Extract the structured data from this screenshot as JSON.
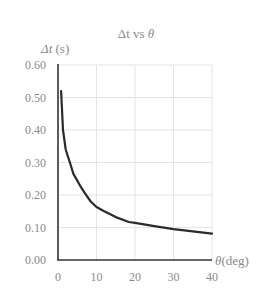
{
  "chart_data": {
    "type": "line",
    "title": "Δt vs θ",
    "xlabel": "θ (deg)",
    "ylabel": "Δt (s)",
    "xlim": [
      0,
      40
    ],
    "ylim": [
      0.0,
      0.6
    ],
    "grid": true,
    "legend": null,
    "x_ticks": [
      "0",
      "10",
      "20",
      "30",
      "40"
    ],
    "y_ticks": [
      "0.00",
      "0.10",
      "0.20",
      "0.30",
      "0.40",
      "0.50",
      "0.60"
    ],
    "series": [
      {
        "name": "Δt",
        "x": [
          0.8,
          1.3,
          2.0,
          3.1,
          4.0,
          5.7,
          7.0,
          8.5,
          10.0,
          12.0,
          15.0,
          18.4,
          20.0,
          25.0,
          30.0,
          35.0,
          40.0
        ],
        "y": [
          0.52,
          0.4,
          0.34,
          0.3,
          0.265,
          0.23,
          0.205,
          0.18,
          0.163,
          0.15,
          0.132,
          0.117,
          0.114,
          0.104,
          0.095,
          0.088,
          0.081
        ]
      }
    ]
  },
  "labels": {
    "title_main": "Δt vs ",
    "title_var": "θ",
    "ylabel_var": "Δt",
    "ylabel_unit": " (s)",
    "xlabel_var": "θ",
    "xlabel_unit": "(deg)"
  }
}
